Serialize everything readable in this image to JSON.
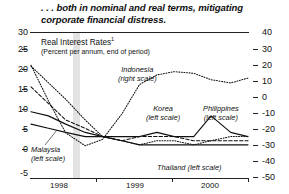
{
  "headline": ". . . both in nominal and real terms, mitigating corporate financial distress.",
  "chart_data": {
    "type": "line",
    "title": "Real Interest Rates",
    "title_footnote": "1",
    "subtitle": "(Percent per annum, end of period)",
    "xlabel": "",
    "ylabel": "",
    "grid": false,
    "legend": "inline-annotations",
    "x_ticks": [
      "1998",
      "1999",
      "2000"
    ],
    "x_range": [
      "1997Q4",
      "2000Q4"
    ],
    "left_axis": {
      "label": "left scale",
      "ylim": [
        -5,
        30
      ],
      "ticks": [
        30,
        25,
        20,
        15,
        10,
        5,
        0,
        -5
      ]
    },
    "right_axis": {
      "label": "right scale",
      "ylim": [
        -50,
        40
      ],
      "ticks": [
        40,
        30,
        20,
        10,
        0,
        -10,
        -20,
        -30,
        -40,
        -50
      ]
    },
    "series": [
      {
        "name": "Indonesia",
        "scale": "right",
        "style": "dotted",
        "annotation": "Indonesia",
        "annotation_scale": "(right scale)",
        "x": [
          0,
          0.08,
          0.16,
          0.25,
          0.33,
          0.42,
          0.5,
          0.58,
          0.66,
          0.75,
          0.83,
          0.92,
          1.0
        ],
        "values": [
          20,
          -2,
          -22,
          -30,
          -26,
          -10,
          8,
          14,
          16,
          15,
          11,
          9,
          12
        ]
      },
      {
        "name": "Korea",
        "scale": "left",
        "style": "dotted",
        "annotation": "Korea",
        "annotation_scale": "(left scale)",
        "x": [
          0,
          0.08,
          0.16,
          0.25,
          0.33,
          0.42,
          0.5,
          0.58,
          0.66,
          0.75,
          0.83,
          0.92,
          1.0
        ],
        "values": [
          22,
          18,
          14,
          9,
          5,
          4,
          3,
          4,
          4,
          3,
          4,
          5,
          5
        ]
      },
      {
        "name": "Malaysia",
        "scale": "left",
        "style": "solid",
        "annotation": "Malaysia",
        "annotation_scale": "(left scale)",
        "x": [
          0,
          0.08,
          0.16,
          0.25,
          0.33,
          0.42,
          0.5,
          0.58,
          0.66,
          0.75,
          0.83,
          0.92,
          1.0
        ],
        "values": [
          11,
          10,
          8,
          6,
          5,
          4,
          3,
          3,
          3,
          3,
          3,
          3,
          3
        ]
      },
      {
        "name": "Philippines",
        "scale": "left",
        "style": "solid",
        "annotation": "Philippines",
        "annotation_scale": "(left scale)",
        "x": [
          0,
          0.08,
          0.16,
          0.25,
          0.33,
          0.42,
          0.5,
          0.58,
          0.66,
          0.75,
          0.83,
          0.92,
          1.0
        ],
        "values": [
          8,
          7,
          6,
          5,
          5,
          5,
          5,
          6,
          5,
          5,
          10,
          6,
          5
        ]
      },
      {
        "name": "Thailand",
        "scale": "left",
        "style": "dashed",
        "annotation": "Thailand",
        "annotation_scale": "(left scale)",
        "x": [
          0,
          0.08,
          0.16,
          0.25,
          0.33,
          0.42,
          0.5,
          0.58,
          0.66,
          0.75,
          0.83,
          0.92,
          1.0
        ],
        "values": [
          17,
          13,
          9,
          7,
          5,
          4,
          5,
          5,
          5,
          4,
          4,
          4,
          4
        ]
      }
    ]
  }
}
